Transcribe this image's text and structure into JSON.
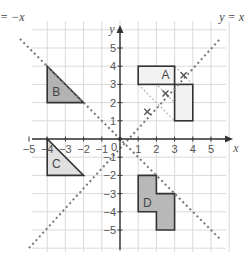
{
  "diagram": {
    "type": "coordinate-grid-transformations",
    "x_axis": {
      "label": "x",
      "ticks": [
        -5,
        -4,
        -3,
        -2,
        -1,
        1,
        2,
        3,
        4,
        5
      ],
      "range": [
        -5.5,
        5.5
      ]
    },
    "y_axis": {
      "label": "y",
      "ticks": [
        5,
        4,
        3,
        2,
        1,
        -1,
        -2,
        -3,
        -4,
        -5
      ],
      "range": [
        -6,
        5.9
      ]
    },
    "origin_label": "0",
    "lines": [
      {
        "id": "y-equals-x",
        "label": "y = x",
        "slope": 1
      },
      {
        "id": "y-equals-neg-x",
        "label": "= −x",
        "slope": -1
      }
    ],
    "shapes": [
      {
        "id": "A",
        "label": "A",
        "fill": "#f2f2f2",
        "points": [
          [
            1,
            4
          ],
          [
            3,
            4
          ],
          [
            3,
            3
          ],
          [
            4,
            3
          ],
          [
            4,
            1
          ],
          [
            3,
            1
          ],
          [
            3,
            3
          ],
          [
            1,
            3
          ]
        ],
        "outline": [
          [
            1,
            4
          ],
          [
            3,
            4
          ],
          [
            3,
            1
          ],
          [
            4,
            1
          ],
          [
            4,
            3
          ],
          [
            1,
            3
          ]
        ]
      },
      {
        "id": "B",
        "label": "B",
        "fill": "#b3b3b3",
        "points": [
          [
            -4,
            4
          ],
          [
            -4,
            2
          ],
          [
            -2,
            2
          ]
        ]
      },
      {
        "id": "C",
        "label": "C",
        "fill": "#e0e0e0",
        "points": [
          [
            -4,
            0
          ],
          [
            -4,
            -2
          ],
          [
            -2,
            -2
          ]
        ]
      },
      {
        "id": "D",
        "label": "D",
        "fill": "#b8b8b8",
        "points": [
          [
            1,
            -2
          ],
          [
            2,
            -2
          ],
          [
            2,
            -3
          ],
          [
            3,
            -3
          ],
          [
            3,
            -5
          ],
          [
            2,
            -5
          ],
          [
            2,
            -4
          ],
          [
            1,
            -4
          ]
        ]
      }
    ],
    "markers": [
      [
        3.5,
        3.5
      ],
      [
        2.5,
        2.5
      ],
      [
        1.5,
        1.5
      ]
    ],
    "construction_lines": [
      [
        [
          1,
          4
        ],
        [
          4,
          1
        ]
      ],
      [
        [
          1,
          3
        ],
        [
          3,
          1
        ]
      ],
      [
        [
          3,
          4
        ],
        [
          4,
          3
        ]
      ]
    ]
  }
}
